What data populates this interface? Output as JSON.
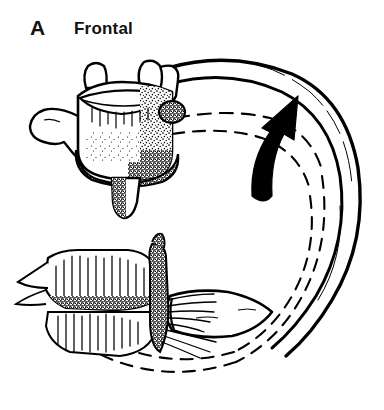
{
  "figure": {
    "panel_letter": "A",
    "title": "Frontal",
    "background_color": "#ffffff",
    "ink_color": "#000000",
    "type": "anatomical-line-drawing"
  },
  "annotations": {
    "motion_arrow": {
      "name": "rib-elevation-arrow",
      "style": "solid-black-curved-arrow",
      "direction": "upward",
      "color": "#000000"
    },
    "ghost_outline": {
      "name": "alternate-rib-position",
      "style": "dashed",
      "color": "#000000"
    }
  },
  "structures": [
    {
      "name": "vertebral-body",
      "shading": "stipple"
    },
    {
      "name": "superior-articular-process-left",
      "shading": "outline"
    },
    {
      "name": "superior-articular-process-right",
      "shading": "outline"
    },
    {
      "name": "transverse-process-left",
      "shading": "outline"
    },
    {
      "name": "costal-facet",
      "shading": "stipple"
    },
    {
      "name": "spinous-process",
      "shading": "stipple"
    },
    {
      "name": "rib-shaft",
      "shading": "outline-band"
    },
    {
      "name": "costal-cartilage",
      "shading": "outline"
    },
    {
      "name": "sternum",
      "shading": "hatch"
    }
  ]
}
